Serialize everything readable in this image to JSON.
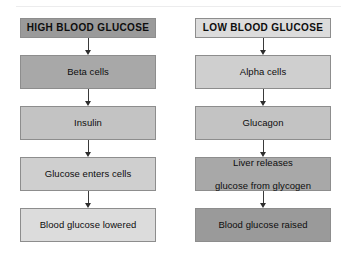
{
  "diagram": {
    "columns": [
      {
        "id": "high-blood-glucose",
        "nodes": [
          {
            "label": "HIGH BLOOD GLUCOSE",
            "shade": "#9a9a9a",
            "style": "header"
          },
          {
            "label": "Beta cells",
            "shade": "#a8a8a8",
            "style": "normal"
          },
          {
            "label": "Insulin",
            "shade": "#c3c3c3",
            "style": "normal"
          },
          {
            "label": "Glucose enters cells",
            "shade": "#cfcfcf",
            "style": "normal"
          },
          {
            "label": "Blood glucose lowered",
            "shade": "#dcdcdc",
            "style": "normal"
          }
        ]
      },
      {
        "id": "low-blood-glucose",
        "nodes": [
          {
            "label": "LOW BLOOD GLUCOSE",
            "shade": "#dcdcdc",
            "style": "header"
          },
          {
            "label": "Alpha cells",
            "shade": "#cfcfcf",
            "style": "normal"
          },
          {
            "label": "Glucagon",
            "shade": "#c3c3c3",
            "style": "normal"
          },
          {
            "label": "Liver releases\nglucose from glycogen",
            "line1": "Liver releases",
            "line2": "glucose from glycogen",
            "shade": "#a8a8a8",
            "style": "normal"
          },
          {
            "label": "Blood glucose raised",
            "shade": "#9a9a9a",
            "style": "normal"
          }
        ]
      }
    ],
    "arrow_count_per_column": 4,
    "colors": {
      "border": "#8d8d8d",
      "text": "#0d0d0d",
      "arrow": "#2d2d2d",
      "background": "#ffffff",
      "top_rule": "#ececed"
    }
  }
}
